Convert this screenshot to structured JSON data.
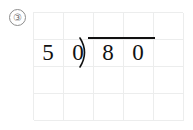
{
  "worksheet": {
    "problem_number": "③",
    "grid": {
      "columns": 5,
      "rows": 4,
      "line_color": "#eceded"
    },
    "division": {
      "divisor_digits": [
        "5",
        "0"
      ],
      "dividend_digits": [
        "8",
        "0"
      ],
      "bracket_glyph": "division-bracket",
      "expression": "50)80",
      "ink_color": "#111111"
    }
  }
}
